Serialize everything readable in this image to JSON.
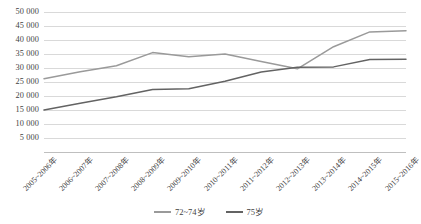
{
  "chart_data": {
    "type": "line",
    "title": "",
    "subtitle": "",
    "xlabel": "",
    "ylabel": "",
    "ylim": [
      0,
      50000
    ],
    "ytick_values": [
      5000,
      10000,
      15000,
      20000,
      25000,
      30000,
      35000,
      40000,
      45000,
      50000
    ],
    "ytick_labels": [
      "5 000",
      "10 000",
      "15 000",
      "20 000",
      "25 000",
      "30 000",
      "35 000",
      "40 000",
      "45 000",
      "50 000"
    ],
    "grid": true,
    "legend_position": "bottom",
    "categories": [
      "2005~2006年",
      "2006~2007年",
      "2007~2008年",
      "2008~2009年",
      "2009~2010年",
      "2010~2011年",
      "2011~2012年",
      "2012~2013年",
      "2013~2014年",
      "2014~2015年",
      "2015~2016年"
    ],
    "series": [
      {
        "name": "72~74岁",
        "color": "#9a9a9a",
        "values": [
          26200,
          28700,
          30800,
          35500,
          34000,
          35000,
          32300,
          29700,
          37600,
          42900,
          43300
        ]
      },
      {
        "name": "75岁",
        "color": "#636363",
        "values": [
          15000,
          17400,
          19700,
          22300,
          22600,
          25300,
          28600,
          30300,
          30400,
          33000,
          33100
        ]
      }
    ]
  },
  "legend": {
    "items": [
      {
        "label": "72~74岁",
        "color": "#9a9a9a"
      },
      {
        "label": "75岁",
        "color": "#636363"
      }
    ]
  },
  "colors": {
    "gridline": "#d9d9d9",
    "axis": "#bfbfbf",
    "text": "#3f3f3f",
    "background": "#ffffff"
  }
}
